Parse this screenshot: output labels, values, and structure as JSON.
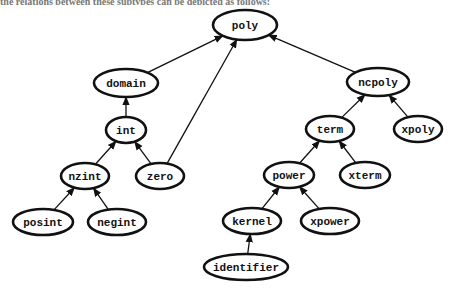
{
  "caption_fragment": "the relations between these subtypes can be depicted as follows:",
  "chart_data": {
    "type": "diagram",
    "kind": "type-hierarchy",
    "nodes": [
      {
        "id": "poly",
        "label": "poly",
        "x": 245,
        "y": 25,
        "w": 64,
        "h": 30
      },
      {
        "id": "domain",
        "label": "domain",
        "x": 126,
        "y": 83,
        "w": 64,
        "h": 28
      },
      {
        "id": "int",
        "label": "int",
        "x": 126,
        "y": 130,
        "w": 40,
        "h": 26
      },
      {
        "id": "nzint",
        "label": "nzint",
        "x": 85,
        "y": 176,
        "w": 48,
        "h": 26
      },
      {
        "id": "zero",
        "label": "zero",
        "x": 160,
        "y": 176,
        "w": 48,
        "h": 26
      },
      {
        "id": "posint",
        "label": "posint",
        "x": 43,
        "y": 222,
        "w": 60,
        "h": 26
      },
      {
        "id": "negint",
        "label": "negint",
        "x": 117,
        "y": 222,
        "w": 58,
        "h": 26
      },
      {
        "id": "ncpoly",
        "label": "ncpoly",
        "x": 378,
        "y": 82,
        "w": 62,
        "h": 28
      },
      {
        "id": "term",
        "label": "term",
        "x": 330,
        "y": 129,
        "w": 48,
        "h": 26
      },
      {
        "id": "xpoly",
        "label": "xpoly",
        "x": 418,
        "y": 129,
        "w": 48,
        "h": 26
      },
      {
        "id": "power",
        "label": "power",
        "x": 289,
        "y": 175,
        "w": 50,
        "h": 26
      },
      {
        "id": "xterm",
        "label": "xterm",
        "x": 365,
        "y": 175,
        "w": 50,
        "h": 26
      },
      {
        "id": "kernel",
        "label": "kernel",
        "x": 252,
        "y": 221,
        "w": 58,
        "h": 26
      },
      {
        "id": "xpower",
        "label": "xpower",
        "x": 330,
        "y": 221,
        "w": 58,
        "h": 26
      },
      {
        "id": "identifier",
        "label": "identifier",
        "x": 246,
        "y": 267,
        "w": 84,
        "h": 26
      }
    ],
    "edges": [
      {
        "from": "domain",
        "to": "poly"
      },
      {
        "from": "zero",
        "to": "poly"
      },
      {
        "from": "ncpoly",
        "to": "poly"
      },
      {
        "from": "int",
        "to": "domain"
      },
      {
        "from": "nzint",
        "to": "int"
      },
      {
        "from": "zero",
        "to": "int"
      },
      {
        "from": "posint",
        "to": "nzint"
      },
      {
        "from": "negint",
        "to": "nzint"
      },
      {
        "from": "term",
        "to": "ncpoly"
      },
      {
        "from": "xpoly",
        "to": "ncpoly"
      },
      {
        "from": "power",
        "to": "term"
      },
      {
        "from": "xterm",
        "to": "term"
      },
      {
        "from": "kernel",
        "to": "power"
      },
      {
        "from": "xpower",
        "to": "power"
      },
      {
        "from": "identifier",
        "to": "kernel"
      }
    ]
  },
  "colors": {
    "stroke": "#111111",
    "background": "#ffffff",
    "bleed_text": "#e6e6e6"
  }
}
